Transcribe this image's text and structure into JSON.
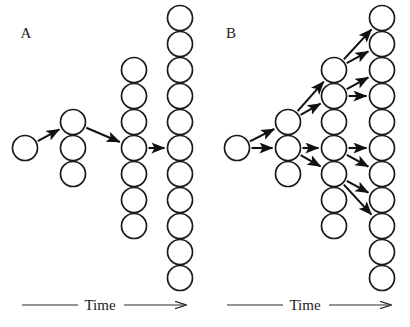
{
  "figure": {
    "background_color": "#ffffff",
    "stroke_color": "#1a1a1a",
    "arrow_color": "#111111",
    "width": 410,
    "height": 327
  },
  "panels": [
    {
      "id": "A",
      "label": "A",
      "label_x": 26,
      "label_y": 38,
      "origin_x": 0,
      "axis": {
        "label": "Time",
        "label_x": 100,
        "label_y": 310,
        "line_left_x1": 22,
        "line_left_x2": 78,
        "line_right_x1": 124,
        "line_right_x2": 186,
        "y": 305
      },
      "columns": [
        {
          "index": 0,
          "cx": 25,
          "count": 1,
          "circle_cy": [
            148
          ],
          "radius": 12.5
        },
        {
          "index": 1,
          "cx": 73,
          "count": 3,
          "circle_cy": [
            122,
            148,
            174
          ],
          "radius": 12.5
        },
        {
          "index": 2,
          "cx": 134,
          "count": 7,
          "circle_cy": [
            70,
            96,
            122,
            148,
            174,
            200,
            226
          ],
          "radius": 12.5
        },
        {
          "index": 3,
          "cx": 180,
          "count": 11,
          "circle_cy": [
            18,
            44,
            70,
            96,
            122,
            148,
            174,
            200,
            226,
            252,
            278
          ],
          "radius": 12.5
        }
      ],
      "arrows": [
        {
          "x1": 25,
          "y1": 148,
          "x2": 73,
          "y2": 122,
          "label": "gen0-to-gen1"
        },
        {
          "x1": 73,
          "y1": 122,
          "x2": 134,
          "y2": 148,
          "label": "gen1-to-gen2"
        },
        {
          "x1": 134,
          "y1": 148,
          "x2": 180,
          "y2": 148,
          "label": "gen2-to-gen3"
        }
      ]
    },
    {
      "id": "B",
      "label": "B",
      "label_x": 231,
      "label_y": 38,
      "origin_x": 205,
      "axis": {
        "label": "Time",
        "label_x": 305,
        "label_y": 310,
        "line_left_x1": 227,
        "line_left_x2": 283,
        "line_right_x1": 329,
        "line_right_x2": 391,
        "y": 305
      },
      "columns": [
        {
          "index": 0,
          "cx": 237,
          "count": 1,
          "circle_cy": [
            148
          ],
          "radius": 12.5
        },
        {
          "index": 1,
          "cx": 288,
          "count": 3,
          "circle_cy": [
            122,
            148,
            174
          ],
          "radius": 12.5
        },
        {
          "index": 2,
          "cx": 334,
          "count": 7,
          "circle_cy": [
            70,
            96,
            122,
            148,
            174,
            200,
            226
          ],
          "radius": 12.5
        },
        {
          "index": 3,
          "cx": 382,
          "count": 11,
          "circle_cy": [
            18,
            44,
            70,
            96,
            122,
            148,
            174,
            200,
            226,
            252,
            278
          ],
          "radius": 12.5
        }
      ],
      "arrows": [
        {
          "x1": 237,
          "y1": 148,
          "x2": 288,
          "y2": 122,
          "label": "gen0-to-gen1-upper"
        },
        {
          "x1": 237,
          "y1": 148,
          "x2": 288,
          "y2": 148,
          "label": "gen0-to-gen1-middle"
        },
        {
          "x1": 288,
          "y1": 122,
          "x2": 334,
          "y2": 70,
          "label": "gen1a-to-gen2a"
        },
        {
          "x1": 288,
          "y1": 122,
          "x2": 334,
          "y2": 96,
          "label": "gen1a-to-gen2b"
        },
        {
          "x1": 288,
          "y1": 148,
          "x2": 334,
          "y2": 148,
          "label": "gen1b-to-gen2d"
        },
        {
          "x1": 288,
          "y1": 148,
          "x2": 334,
          "y2": 174,
          "label": "gen1b-to-gen2e"
        },
        {
          "x1": 334,
          "y1": 70,
          "x2": 382,
          "y2": 18,
          "label": "gen2a-to-gen3a"
        },
        {
          "x1": 334,
          "y1": 70,
          "x2": 382,
          "y2": 44,
          "label": "gen2a-to-gen3b"
        },
        {
          "x1": 334,
          "y1": 96,
          "x2": 382,
          "y2": 70,
          "label": "gen2b-to-gen3c"
        },
        {
          "x1": 334,
          "y1": 96,
          "x2": 382,
          "y2": 96,
          "label": "gen2b-to-gen3d"
        },
        {
          "x1": 334,
          "y1": 148,
          "x2": 382,
          "y2": 148,
          "label": "gen2d-to-gen3f"
        },
        {
          "x1": 334,
          "y1": 148,
          "x2": 382,
          "y2": 174,
          "label": "gen2d-to-gen3g"
        },
        {
          "x1": 334,
          "y1": 174,
          "x2": 382,
          "y2": 200,
          "label": "gen2e-to-gen3h"
        },
        {
          "x1": 334,
          "y1": 174,
          "x2": 382,
          "y2": 226,
          "label": "gen2e-to-gen3i"
        }
      ]
    }
  ]
}
